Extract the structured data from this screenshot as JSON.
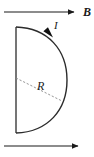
{
  "figure": {
    "type": "physics-diagram",
    "background_color": "#ffffff",
    "stroke_color": "#1a1a1a",
    "dash_color": "#8a8a8a",
    "labels": {
      "magnetic_field": "B",
      "current": "I",
      "radius": "R"
    },
    "field_arrows": [
      {
        "name": "top-field-arrow",
        "x1": 4,
        "y1": 12,
        "x2": 78,
        "y2": 12,
        "label": "B",
        "label_x": 83,
        "label_y": 6
      },
      {
        "name": "bottom-field-arrow",
        "x1": 4,
        "y1": 146,
        "x2": 82,
        "y2": 146,
        "label": "",
        "label_x": 0,
        "label_y": 0
      }
    ],
    "loop": {
      "diameter_x": 16,
      "top_y": 27,
      "bottom_y": 133,
      "arc_max_x": 67,
      "center_y": 80,
      "radius_px": 53
    },
    "current_arrowhead": {
      "name": "current-direction-arrowhead",
      "x": 49,
      "y": 33,
      "angle_deg": 48
    },
    "radius_line": {
      "x1": 16,
      "y1": 78,
      "x2": 62,
      "y2": 101,
      "style": "dashed",
      "label": "R",
      "label_x": 37,
      "label_y": 80
    }
  }
}
